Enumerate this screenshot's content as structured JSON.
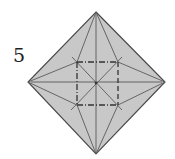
{
  "diagram": {
    "step_number": "5",
    "colors": {
      "paper_fill": "#c8c8c8",
      "paper_edge": "#4a4a4a",
      "crease": "#5a5a5a",
      "fold_line": "#333333",
      "text": "#222222"
    },
    "paper": {
      "shape": "diamond",
      "vertices": {
        "top": [
          96,
          12
        ],
        "right": [
          165,
          82
        ],
        "bottom": [
          96,
          154
        ],
        "left": [
          28,
          82
        ]
      }
    },
    "center": [
      96,
      83
    ],
    "inner_square": {
      "x1": 77,
      "y1": 62,
      "x2": 118,
      "y2": 105,
      "style": "dash-dot (mountain/valley fold lines)"
    },
    "creases": [
      {
        "name": "vertical-center",
        "from": [
          96,
          14
        ],
        "to": [
          96,
          152
        ]
      },
      {
        "name": "horizontal-center",
        "from": [
          31,
          82
        ],
        "to": [
          162,
          82
        ]
      },
      {
        "name": "diag-tl-br",
        "from": [
          72,
          57
        ],
        "to": [
          122,
          110
        ]
      },
      {
        "name": "diag-tr-bl",
        "from": [
          122,
          57
        ],
        "to": [
          71,
          110
        ]
      },
      {
        "name": "top-fan-left",
        "from": [
          96,
          12
        ],
        "to": [
          77,
          62
        ]
      },
      {
        "name": "top-fan-right",
        "from": [
          96,
          12
        ],
        "to": [
          118,
          62
        ]
      },
      {
        "name": "bottom-fan-left",
        "from": [
          96,
          154
        ],
        "to": [
          77,
          105
        ]
      },
      {
        "name": "bottom-fan-right",
        "from": [
          96,
          154
        ],
        "to": [
          118,
          105
        ]
      },
      {
        "name": "left-fan-top",
        "from": [
          28,
          82
        ],
        "to": [
          77,
          62
        ]
      },
      {
        "name": "left-fan-bottom",
        "from": [
          28,
          82
        ],
        "to": [
          77,
          105
        ]
      },
      {
        "name": "right-fan-top",
        "from": [
          165,
          82
        ],
        "to": [
          118,
          62
        ]
      },
      {
        "name": "right-fan-bottom",
        "from": [
          165,
          82
        ],
        "to": [
          118,
          105
        ]
      }
    ]
  }
}
